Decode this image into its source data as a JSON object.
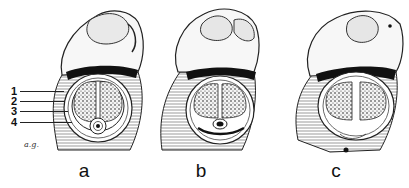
{
  "figure": {
    "panels": [
      {
        "id": "a",
        "label": "a"
      },
      {
        "id": "b",
        "label": "b"
      },
      {
        "id": "c",
        "label": "c"
      }
    ],
    "callouts": [
      {
        "number": "1"
      },
      {
        "number": "2"
      },
      {
        "number": "3"
      },
      {
        "number": "4"
      }
    ],
    "signature": "a.g."
  },
  "colors": {
    "ink": "#111111",
    "background": "#ffffff",
    "stipple_fill": "#f4f4f4"
  }
}
